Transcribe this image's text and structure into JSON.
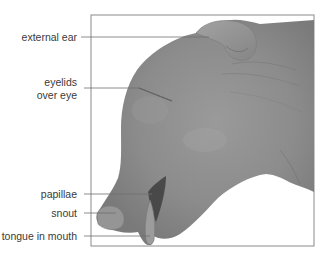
{
  "figure": {
    "frame_color": "#8a8a8a",
    "leader_color": "#6f6f6f",
    "skin_color": "#8e8e8e",
    "skin_shadow": "#6e6e6e",
    "skin_highlight": "#a4a4a4"
  },
  "labels": [
    {
      "id": "external-ear",
      "line1": "external ear",
      "line2": ""
    },
    {
      "id": "eyelids",
      "line1": "eyelids",
      "line2": "over eye"
    },
    {
      "id": "papillae",
      "line1": "papillae",
      "line2": ""
    },
    {
      "id": "snout",
      "line1": "snout",
      "line2": ""
    },
    {
      "id": "tongue",
      "line1": "tongue in mouth",
      "line2": ""
    }
  ]
}
